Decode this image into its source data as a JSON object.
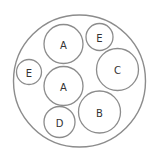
{
  "diagram": {
    "type": "circle-packing",
    "stroke_color": "#8c8c8c",
    "label_color": "#333333",
    "outer": {
      "cx": 79.5,
      "cy": 81,
      "r": 66
    },
    "circles": [
      {
        "label": "A",
        "cx": 63.5,
        "cy": 44,
        "r": 19.5
      },
      {
        "label": "E",
        "cx": 99.5,
        "cy": 37,
        "r": 13.5
      },
      {
        "label": "E",
        "cx": 29,
        "cy": 72,
        "r": 12.5
      },
      {
        "label": "C",
        "cx": 117.5,
        "cy": 69.5,
        "r": 21
      },
      {
        "label": "A",
        "cx": 63.5,
        "cy": 86,
        "r": 19.5
      },
      {
        "label": "B",
        "cx": 99.5,
        "cy": 112,
        "r": 21
      },
      {
        "label": "D",
        "cx": 59.5,
        "cy": 122,
        "r": 15.5
      }
    ]
  }
}
